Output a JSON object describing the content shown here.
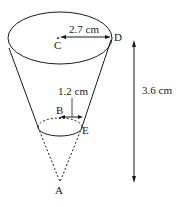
{
  "diagram": {
    "type": "truncated cone (frustum) with apex",
    "points": {
      "A": "A",
      "B": "B",
      "C": "C",
      "D": "D",
      "E": "E"
    },
    "measurements": {
      "top_radius": "2.7 cm",
      "bottom_radius": "1.2 cm",
      "height": "3.6 cm"
    },
    "colors": {
      "stroke": "#1a1a1a",
      "background": "#ffffff"
    }
  }
}
